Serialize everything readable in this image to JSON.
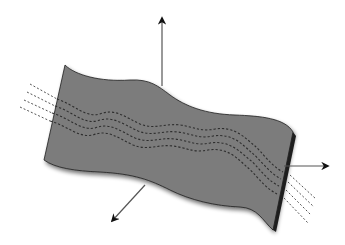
{
  "diagram": {
    "colors": {
      "background": "#ffffff",
      "sheet_fill": "#7b7b7b",
      "sheet_edge": "#1e1e1e",
      "axis": "#555555",
      "arrowhead": "#111111",
      "dash_on_sheet": "#2e2e2e",
      "dash_off_sheet": "#555555"
    },
    "axes": [
      {
        "name": "vertical-axis",
        "x1": 162,
        "y1": 86,
        "x2": 162,
        "y2": 16
      },
      {
        "name": "right-axis",
        "x1": 284,
        "y1": 166,
        "x2": 330,
        "y2": 166
      },
      {
        "name": "lower-left-axis",
        "x1": 145,
        "y1": 185,
        "x2": 110,
        "y2": 223
      }
    ],
    "labels": []
  }
}
